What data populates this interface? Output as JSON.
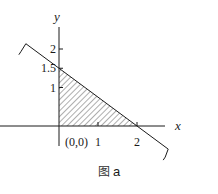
{
  "figure": {
    "caption_glyph": "图",
    "caption_label": "a",
    "x_axis_label": "x",
    "y_axis_label": "y",
    "origin_label": "(0,0)",
    "x_ticks": [
      {
        "value": 1,
        "label": "1"
      },
      {
        "value": 2,
        "label": "2"
      }
    ],
    "y_ticks": [
      {
        "value": 1,
        "label": "1"
      },
      {
        "value": 1.5,
        "label": "1.5"
      },
      {
        "value": 2,
        "label": "2"
      }
    ],
    "boundary_line": {
      "description": "3x + 4y = 6",
      "x_intercept": 2,
      "y_intercept": 1.5,
      "extends_x_range": [
        -0.85,
        2.8
      ]
    },
    "shaded_region": {
      "description": "feasible region x>=0, y>=0, 3x+4y<=6",
      "vertices": [
        [
          0,
          0
        ],
        [
          2,
          0
        ],
        [
          0,
          1.5
        ]
      ],
      "fill_pattern": "diagonal-hatch"
    },
    "stroke_color": "#1a1a1a"
  }
}
